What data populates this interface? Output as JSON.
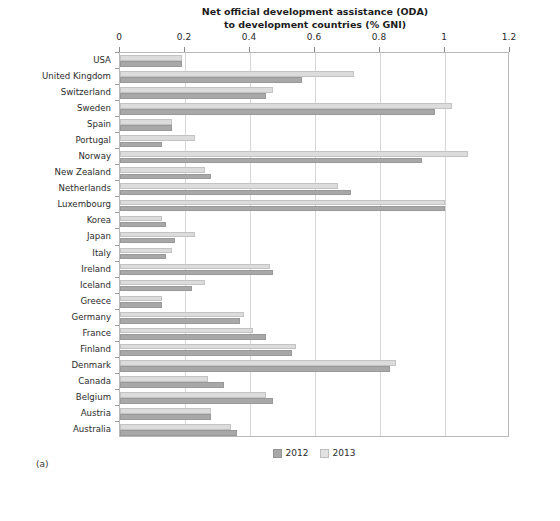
{
  "figure": {
    "panel_label": "(a)"
  },
  "chart_data": {
    "type": "bar",
    "orientation": "horizontal",
    "title": "Net official development assistance (ODA) to development countries (% GNI)",
    "title_lines": [
      "Net official development assistance (ODA)",
      "to development countries (% GNI)"
    ],
    "xlabel": "",
    "ylabel": "",
    "xlim": [
      0,
      1.2
    ],
    "xticks": [
      0,
      0.2,
      0.4,
      0.6,
      0.8,
      1,
      1.2
    ],
    "xtick_labels": [
      "0",
      "0.2",
      "0.4",
      "0.6",
      "0.8",
      "1",
      "1.2"
    ],
    "grid": "vertical",
    "legend_position": "bottom-center",
    "categories": [
      "USA",
      "United Kingdom",
      "Switzerland",
      "Sweden",
      "Spain",
      "Portugal",
      "Norway",
      "New Zealand",
      "Netherlands",
      "Luxembourg",
      "Korea",
      "Japan",
      "Italy",
      "Ireland",
      "Iceland",
      "Greece",
      "Germany",
      "France",
      "Finland",
      "Denmark",
      "Canada",
      "Belgium",
      "Austria",
      "Australia"
    ],
    "series": [
      {
        "name": "2013",
        "color": "#dcdcdc",
        "values": [
          0.19,
          0.72,
          0.47,
          1.02,
          0.16,
          0.23,
          1.07,
          0.26,
          0.67,
          1.0,
          0.13,
          0.23,
          0.16,
          0.46,
          0.26,
          0.13,
          0.38,
          0.41,
          0.54,
          0.85,
          0.27,
          0.45,
          0.28,
          0.34
        ]
      },
      {
        "name": "2012",
        "color": "#a8a8a8",
        "values": [
          0.19,
          0.56,
          0.45,
          0.97,
          0.16,
          0.13,
          0.93,
          0.28,
          0.71,
          1.0,
          0.14,
          0.17,
          0.14,
          0.47,
          0.22,
          0.13,
          0.37,
          0.45,
          0.53,
          0.83,
          0.32,
          0.47,
          0.28,
          0.36
        ]
      }
    ]
  },
  "legend": {
    "entries": [
      {
        "label": "2012",
        "swatch": "s2012"
      },
      {
        "label": "2013",
        "swatch": "s2013"
      }
    ]
  }
}
